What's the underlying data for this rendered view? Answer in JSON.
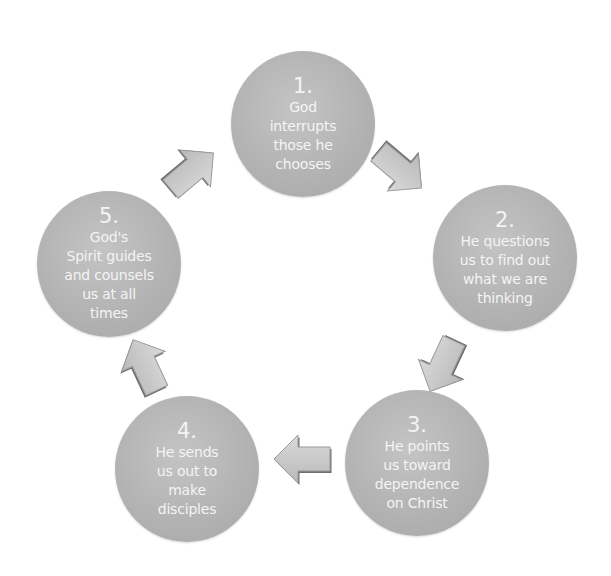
{
  "diagram": {
    "type": "cycle",
    "colors": {
      "background": "#ffffff",
      "node_fill": "#b5b5b5",
      "node_text": "#f4f4f4",
      "arrow_fill": "#c8c8c8",
      "arrow_shadow": "#6e6e6e"
    },
    "nodes": [
      {
        "number": "1.",
        "lines": [
          "God",
          "interrupts",
          "those he",
          "chooses"
        ]
      },
      {
        "number": "2.",
        "lines": [
          "He questions",
          "us to find out",
          "what we are",
          "thinking"
        ]
      },
      {
        "number": "3.",
        "lines": [
          "He points",
          "us toward",
          "dependence",
          "on Christ"
        ]
      },
      {
        "number": "4.",
        "lines": [
          "He sends",
          "us out to",
          "make",
          "disciples"
        ]
      },
      {
        "number": "5.",
        "lines": [
          "God's",
          "Spirit guides",
          "and counsels",
          "us at all",
          "times"
        ]
      }
    ],
    "arrows": [
      {
        "from": "1",
        "to": "2",
        "direction": "down-right-arrow"
      },
      {
        "from": "2",
        "to": "3",
        "direction": "down-left-arrow"
      },
      {
        "from": "3",
        "to": "4",
        "direction": "left-arrow"
      },
      {
        "from": "4",
        "to": "5",
        "direction": "up-left-arrow"
      },
      {
        "from": "5",
        "to": "1",
        "direction": "up-right-arrow"
      }
    ]
  }
}
